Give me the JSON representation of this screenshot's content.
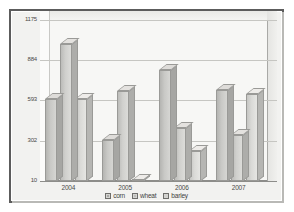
{
  "chart_data": {
    "type": "bar",
    "title": "",
    "subtitle": "",
    "xlabel": "",
    "ylabel": "",
    "categories": [
      "2004",
      "2005",
      "2006",
      "2007"
    ],
    "series": [
      {
        "name": "corn",
        "values": [
          600,
          310,
          810,
          670
        ]
      },
      {
        "name": "wheat",
        "values": [
          1000,
          660,
          390,
          340
        ]
      },
      {
        "name": "barley",
        "values": [
          600,
          20,
          230,
          640
        ]
      }
    ],
    "ylim": [
      10,
      1175
    ],
    "yticks": [
      "1175",
      "884",
      "593",
      "302",
      "10"
    ],
    "ytick_values": [
      1175,
      884,
      593,
      302,
      10
    ],
    "grid": true,
    "legend_position": "bottom",
    "style": "3d-grouped-bars-grayscale"
  },
  "legend": {
    "items": [
      {
        "label": "corn",
        "swatch": "series-0-swatch"
      },
      {
        "label": "wheat",
        "swatch": "series-1-swatch"
      },
      {
        "label": "barley",
        "swatch": "series-2-swatch"
      }
    ]
  },
  "colors": {
    "frame": "#5c5c5c",
    "plot_background": "#f7f7f5",
    "gridline": "#c6c6c2",
    "axis": "#8d8d8a",
    "text": "#4a4a48",
    "series_corn": "#c9c9c6",
    "series_wheat": "#d0d0cd",
    "series_barley": "#dadad7"
  }
}
